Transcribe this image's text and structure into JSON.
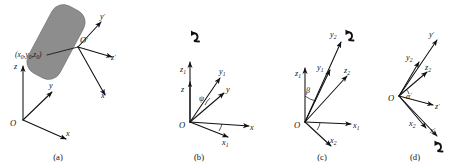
{
  "figure": {
    "background_color": "#ffffff",
    "ink_color": "#111111",
    "body_fill_color": "#8d8d8d",
    "panel_count": 4
  },
  "panels": [
    {
      "id": "a",
      "caption": "(a)",
      "description": "Rigid body with fixed reference frame and attached body frame",
      "origin_label": "O",
      "body_origin_label": "O",
      "body_origin_prime": "′",
      "coordinate_label": "(x",
      "coordinate_full": "(x0, y0, z0)",
      "coord_parts": {
        "open": "(",
        "x": "x",
        "x_sub": "0",
        "c1": ",",
        "y": "y",
        "y_sub": "0",
        "c2": ",",
        "z": "z",
        "z_sub": "0",
        "close": ")"
      },
      "axes": [
        {
          "name": "z",
          "label": "z",
          "sub": "",
          "prime": ""
        },
        {
          "name": "y",
          "label": "y",
          "sub": "",
          "prime": ""
        },
        {
          "name": "x",
          "label": "x",
          "sub": "",
          "prime": ""
        },
        {
          "name": "y-prime",
          "label": "y",
          "sub": "",
          "prime": "′"
        },
        {
          "name": "z-prime",
          "label": "z",
          "sub": "",
          "prime": "′"
        },
        {
          "name": "x-prime",
          "label": "x",
          "sub": "",
          "prime": "′"
        }
      ],
      "has_body": true,
      "has_rotation_arrow": false
    },
    {
      "id": "b",
      "caption": "(b)",
      "description": "First rotation by angle psi about the z axis",
      "origin_label": "O",
      "angle_symbol": "ψ",
      "rotation_axis": "z",
      "axes": [
        {
          "name": "z1",
          "label": "z",
          "sub": "1",
          "prime": ""
        },
        {
          "name": "z",
          "label": "z",
          "sub": "",
          "prime": ""
        },
        {
          "name": "y1",
          "label": "y",
          "sub": "1",
          "prime": ""
        },
        {
          "name": "y",
          "label": "y",
          "sub": "",
          "prime": ""
        },
        {
          "name": "x",
          "label": "x",
          "sub": "",
          "prime": ""
        },
        {
          "name": "x1",
          "label": "x",
          "sub": "1",
          "prime": ""
        }
      ],
      "has_body": false,
      "has_rotation_arrow": true
    },
    {
      "id": "c",
      "caption": "(c)",
      "description": "Second rotation by angle beta about the x1 axis",
      "origin_label": "O",
      "angle_symbol": "β",
      "rotation_axis": "y2",
      "axes": [
        {
          "name": "z1",
          "label": "z",
          "sub": "1",
          "prime": ""
        },
        {
          "name": "y1",
          "label": "y",
          "sub": "1",
          "prime": ""
        },
        {
          "name": "y2",
          "label": "y",
          "sub": "2",
          "prime": ""
        },
        {
          "name": "z2",
          "label": "z",
          "sub": "2",
          "prime": ""
        },
        {
          "name": "x1",
          "label": "x",
          "sub": "1",
          "prime": ""
        },
        {
          "name": "x2",
          "label": "x",
          "sub": "2",
          "prime": ""
        }
      ],
      "has_body": false,
      "has_rotation_arrow": true
    },
    {
      "id": "d",
      "caption": "(d)",
      "description": "Third rotation by angle alpha prime about the x prime axis",
      "origin_label": "O",
      "angle_symbol": "α",
      "angle_prime": "′",
      "rotation_axis": "x-prime",
      "axes": [
        {
          "name": "y-prime",
          "label": "y",
          "sub": "",
          "prime": "′"
        },
        {
          "name": "y2",
          "label": "y",
          "sub": "2",
          "prime": ""
        },
        {
          "name": "z2",
          "label": "z",
          "sub": "2",
          "prime": ""
        },
        {
          "name": "z-prime",
          "label": "z",
          "sub": "",
          "prime": "′"
        },
        {
          "name": "x2",
          "label": "x",
          "sub": "2",
          "prime": ""
        },
        {
          "name": "x-prime",
          "label": "x",
          "sub": "",
          "prime": "′"
        }
      ],
      "has_body": false,
      "has_rotation_arrow": true
    }
  ]
}
